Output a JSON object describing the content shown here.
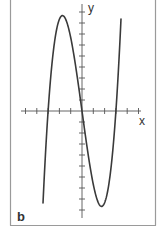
{
  "chart_data": {
    "type": "line",
    "title": "",
    "panel_label": "b",
    "xlabel": "x",
    "ylabel": "y",
    "function": "cubic with positive leading coefficient",
    "x_ticks_count_left": 5,
    "x_ticks_count_right": 5,
    "y_ticks_count_up": 9,
    "y_ticks_count_down": 9,
    "xlim": [
      -5.5,
      5.5
    ],
    "ylim": [
      -9.5,
      9.5
    ],
    "roots": [
      -3,
      0,
      3
    ],
    "local_max": {
      "x": -1.6,
      "y": 8.6
    },
    "local_min": {
      "x": 1.6,
      "y": -8.6
    },
    "series": [
      {
        "name": "f(x)",
        "points": [
          {
            "x": -3.5,
            "y": -9.2
          },
          {
            "x": -3.0,
            "y": 0
          },
          {
            "x": -2.5,
            "y": 5.5
          },
          {
            "x": -1.6,
            "y": 8.6
          },
          {
            "x": -1.0,
            "y": 7.0
          },
          {
            "x": 0.0,
            "y": 0
          },
          {
            "x": 1.0,
            "y": -7.0
          },
          {
            "x": 1.6,
            "y": -8.6
          },
          {
            "x": 2.5,
            "y": -5.5
          },
          {
            "x": 3.0,
            "y": 0
          },
          {
            "x": 3.5,
            "y": 9.2
          }
        ]
      }
    ],
    "grid": false,
    "legend": null
  },
  "colors": {
    "curve": "#3a3a3a",
    "axes": "#555555",
    "frame": "#9a9a9a",
    "background": "#ffffff"
  }
}
